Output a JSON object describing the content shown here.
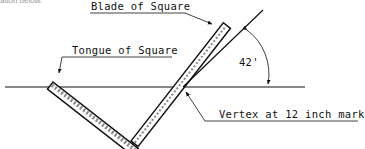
{
  "diagram": {
    "title_fragment": "ation below.",
    "labels": {
      "blade": "Blade of Square",
      "tongue": "Tongue of Square",
      "vertex": "Vertex at 12 inch mark",
      "angle": "42'"
    },
    "colors": {
      "ink": "#111111",
      "background": "#ffffff"
    },
    "geometry": {
      "horizon_line": {
        "x1": 5,
        "y1": 87,
        "x2": 305,
        "y2": 87
      },
      "vertex_point": {
        "x": 183,
        "y": 87
      },
      "square_corner": {
        "x": 135,
        "y": 148
      },
      "angle_degrees": 42
    }
  }
}
